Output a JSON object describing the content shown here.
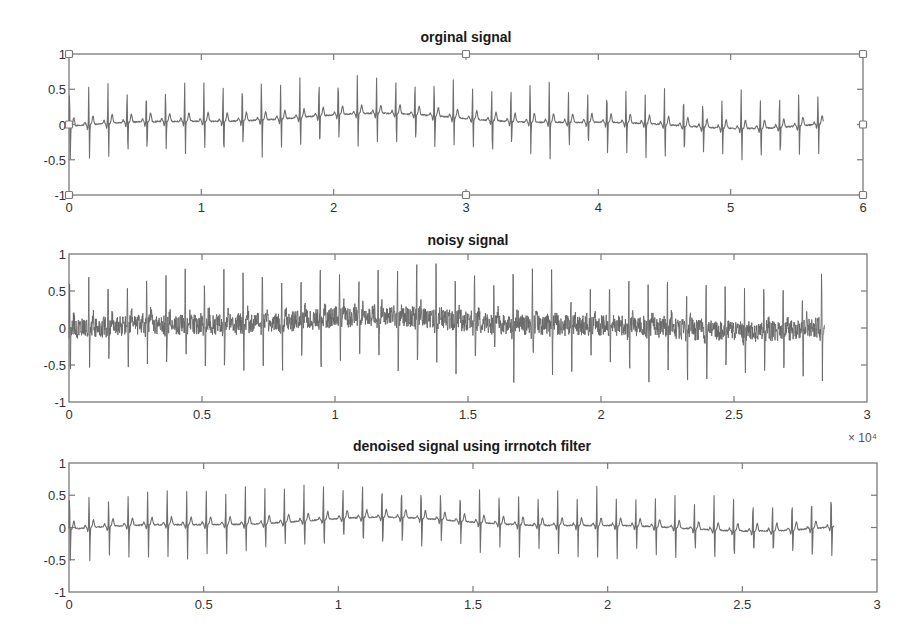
{
  "figure": {
    "background": "#ffffff",
    "line_color": "#6e6e6e",
    "axes_color": "#7a7a7a"
  },
  "chart_data": [
    {
      "type": "line",
      "title": "orginal signal",
      "xlabel": "",
      "ylabel": "",
      "xlim": [
        0,
        6
      ],
      "ylim": [
        -1,
        1
      ],
      "xticks": [
        0,
        1,
        2,
        3,
        4,
        5,
        6
      ],
      "xtick_labels": [
        "0",
        "1",
        "2",
        "3",
        "4",
        "5",
        "6"
      ],
      "yticks": [
        -1,
        -0.5,
        0,
        0.5,
        1
      ],
      "ytick_labels": [
        "-1",
        "-0.5",
        "0",
        "0.5",
        "1"
      ],
      "x_multiplier": "",
      "grid": false,
      "selected": true,
      "series": [
        {
          "name": "original ECG",
          "x_end": 5.7,
          "beat_interval": 0.145,
          "r_peak_range": [
            0.4,
            0.62
          ],
          "s_trough_range": [
            -0.55,
            -0.36
          ],
          "baseline_wander": [
            -0.05,
            0.15
          ],
          "noise_level": 0.01
        }
      ]
    },
    {
      "type": "line",
      "title": "noisy signal",
      "xlabel": "",
      "ylabel": "",
      "xlim": [
        0,
        3
      ],
      "ylim": [
        -1,
        1
      ],
      "xticks": [
        0,
        0.5,
        1,
        1.5,
        2,
        2.5,
        3
      ],
      "xtick_labels": [
        "0",
        "0.5",
        "1",
        "1.5",
        "2",
        "2.5",
        "3"
      ],
      "yticks": [
        -1,
        -0.5,
        0,
        0.5,
        1
      ],
      "ytick_labels": [
        "-1",
        "-0.5",
        "0",
        "0.5",
        "1"
      ],
      "x_multiplier": "× 10⁴",
      "grid": false,
      "selected": false,
      "series": [
        {
          "name": "noisy ECG",
          "x_end": 2.84,
          "beat_interval": 0.0725,
          "r_peak_range": [
            0.45,
            0.8
          ],
          "s_trough_range": [
            -0.72,
            -0.45
          ],
          "baseline_wander": [
            -0.05,
            0.15
          ],
          "noise_level": 0.14
        }
      ]
    },
    {
      "type": "line",
      "title": "denoised signal using irrnotch filter",
      "xlabel": "",
      "ylabel": "",
      "xlim": [
        0,
        3
      ],
      "ylim": [
        -1,
        1
      ],
      "xticks": [
        0,
        0.5,
        1,
        1.5,
        2,
        2.5,
        3
      ],
      "xtick_labels": [
        "0",
        "0.5",
        "1",
        "1.5",
        "2",
        "2.5",
        "3"
      ],
      "yticks": [
        -1,
        -0.5,
        0,
        0.5,
        1
      ],
      "ytick_labels": [
        "-1",
        "-0.5",
        "0",
        "0.5",
        "1"
      ],
      "x_multiplier": "",
      "grid": false,
      "selected": false,
      "series": [
        {
          "name": "denoised ECG",
          "x_end": 2.84,
          "beat_interval": 0.0725,
          "r_peak_range": [
            0.4,
            0.62
          ],
          "s_trough_range": [
            -0.55,
            -0.36
          ],
          "baseline_wander": [
            -0.05,
            0.15
          ],
          "noise_level": 0.01
        }
      ]
    }
  ]
}
